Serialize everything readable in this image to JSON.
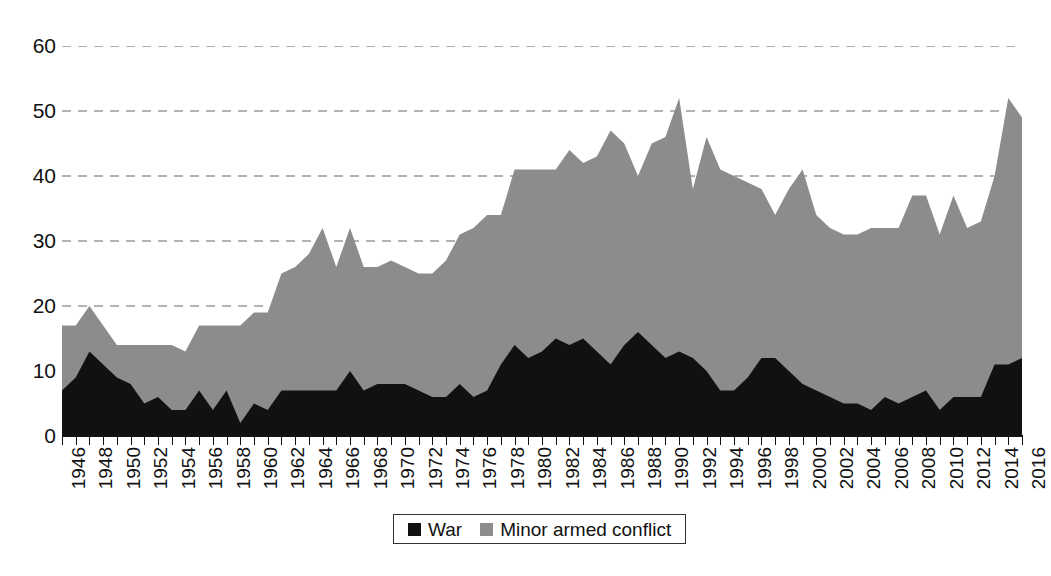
{
  "chart_data": {
    "type": "area",
    "stacked": true,
    "title": "",
    "subtitle": "",
    "xlabel": "",
    "ylabel": "",
    "ylim": [
      0,
      60
    ],
    "ytick_values": [
      0,
      10,
      20,
      30,
      40,
      50,
      60
    ],
    "ytick_labels": [
      "0",
      "10",
      "20",
      "30",
      "40",
      "50",
      "60"
    ],
    "xlim": [
      1946,
      2016
    ],
    "xtick_labels": [
      "1946",
      "1948",
      "1950",
      "1952",
      "1954",
      "1956",
      "1958",
      "1960",
      "1962",
      "1964",
      "1966",
      "1968",
      "1970",
      "1972",
      "1974",
      "1976",
      "1978",
      "1980",
      "1982",
      "1984",
      "1986",
      "1988",
      "1990",
      "1992",
      "1994",
      "1996",
      "1998",
      "2000",
      "2002",
      "2004",
      "2006",
      "2008",
      "2010",
      "2012",
      "2014",
      "2016"
    ],
    "xtick_label_rotation": -90,
    "grid": "horizontal-dashed",
    "legend_position": "bottom-center",
    "x": [
      1946,
      1947,
      1948,
      1949,
      1950,
      1951,
      1952,
      1953,
      1954,
      1955,
      1956,
      1957,
      1958,
      1959,
      1960,
      1961,
      1962,
      1963,
      1964,
      1965,
      1966,
      1967,
      1968,
      1969,
      1970,
      1971,
      1972,
      1973,
      1974,
      1975,
      1976,
      1977,
      1978,
      1979,
      1980,
      1981,
      1982,
      1983,
      1984,
      1985,
      1986,
      1987,
      1988,
      1989,
      1990,
      1991,
      1992,
      1993,
      1994,
      1995,
      1996,
      1997,
      1998,
      1999,
      2000,
      2001,
      2002,
      2003,
      2004,
      2005,
      2006,
      2007,
      2008,
      2009,
      2010,
      2011,
      2012,
      2013,
      2014,
      2015,
      2016
    ],
    "series": [
      {
        "name": "War",
        "color": "#111111",
        "values": [
          7,
          9,
          13,
          11,
          9,
          8,
          5,
          6,
          4,
          4,
          7,
          4,
          7,
          2,
          5,
          4,
          7,
          7,
          7,
          7,
          7,
          10,
          7,
          8,
          8,
          8,
          7,
          6,
          6,
          8,
          6,
          7,
          11,
          14,
          12,
          13,
          15,
          14,
          15,
          13,
          11,
          14,
          16,
          14,
          12,
          13,
          12,
          10,
          7,
          7,
          9,
          12,
          12,
          10,
          8,
          7,
          6,
          5,
          5,
          4,
          6,
          5,
          6,
          7,
          4,
          6,
          6,
          6,
          11,
          11,
          12
        ]
      },
      {
        "name": "Minor armed conflict",
        "color": "#8c8c8c",
        "values": [
          10,
          8,
          7,
          6,
          5,
          6,
          9,
          8,
          10,
          9,
          10,
          13,
          10,
          15,
          14,
          15,
          18,
          19,
          21,
          25,
          19,
          22,
          19,
          18,
          19,
          18,
          18,
          19,
          21,
          23,
          26,
          27,
          23,
          27,
          29,
          28,
          26,
          30,
          27,
          30,
          36,
          31,
          24,
          31,
          34,
          39,
          26,
          36,
          34,
          33,
          30,
          26,
          22,
          28,
          33,
          27,
          26,
          26,
          26,
          28,
          26,
          27,
          31,
          30,
          27,
          31,
          26,
          27,
          29,
          41,
          37
        ]
      }
    ],
    "totals": [
      17,
      17,
      20,
      17,
      14,
      14,
      14,
      14,
      14,
      13,
      17,
      17,
      17,
      17,
      19,
      19,
      25,
      26,
      28,
      32,
      26,
      32,
      26,
      26,
      27,
      26,
      25,
      25,
      27,
      31,
      32,
      34,
      34,
      41,
      41,
      41,
      41,
      44,
      42,
      43,
      47,
      45,
      40,
      45,
      46,
      52,
      38,
      46,
      41,
      40,
      39,
      38,
      34,
      38,
      41,
      34,
      32,
      31,
      31,
      32,
      32,
      32,
      37,
      37,
      31,
      37,
      32,
      33,
      40,
      52,
      49
    ]
  },
  "legend": {
    "entries": [
      {
        "label": "War",
        "swatch_color": "#111111",
        "swatch_name": "legend-swatch-war"
      },
      {
        "label": "Minor armed conflict",
        "swatch_color": "#8c8c8c",
        "swatch_name": "legend-swatch-minor-armed-conflict"
      }
    ]
  },
  "axes": {
    "y_labels": [
      "60",
      "50",
      "40",
      "30",
      "20",
      "10",
      "0"
    ],
    "x_labels": [
      "1946",
      "1948",
      "1950",
      "1952",
      "1954",
      "1956",
      "1958",
      "1960",
      "1962",
      "1964",
      "1966",
      "1968",
      "1970",
      "1972",
      "1974",
      "1976",
      "1978",
      "1980",
      "1982",
      "1984",
      "1986",
      "1988",
      "1990",
      "1992",
      "1994",
      "1996",
      "1998",
      "2000",
      "2002",
      "2004",
      "2006",
      "2008",
      "2010",
      "2012",
      "2014",
      "2016"
    ]
  },
  "colors": {
    "war": "#111111",
    "minor_armed_conflict": "#8c8c8c",
    "gridline": "#9a9a9a",
    "axis": "#111111",
    "background": "#ffffff"
  },
  "caption": ""
}
